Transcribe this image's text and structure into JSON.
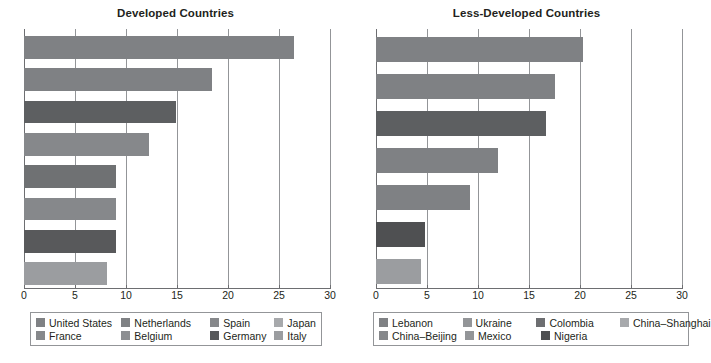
{
  "chart_data": [
    {
      "type": "bar",
      "orientation": "horizontal",
      "title": "Developed Countries",
      "xlabel": "",
      "ylabel": "",
      "xlim": [
        0,
        30
      ],
      "xticks": [
        0,
        5,
        10,
        15,
        20,
        25,
        30
      ],
      "grid": true,
      "legend_position": "bottom",
      "categories": [
        "United States",
        "Netherlands",
        "Spain",
        "Japan",
        "France",
        "Belgium",
        "Germany",
        "Italy"
      ],
      "values": [
        26.5,
        18.4,
        14.9,
        12.3,
        9.0,
        9.0,
        9.0,
        8.1
      ],
      "colors": [
        "#7f8184",
        "#7f8184",
        "#5d5f61",
        "#86888b",
        "#6f7173",
        "#86888b",
        "#58595b",
        "#9b9da0"
      ],
      "legend": [
        {
          "label": "United States",
          "color": "#7f8184"
        },
        {
          "label": "Netherlands",
          "color": "#7f8184"
        },
        {
          "label": "Spain",
          "color": "#86888b"
        },
        {
          "label": "Japan",
          "color": "#a7a9ac"
        },
        {
          "label": "France",
          "color": "#86888b"
        },
        {
          "label": "Belgium",
          "color": "#8d8f92"
        },
        {
          "label": "Germany",
          "color": "#58595b"
        },
        {
          "label": "Italy",
          "color": "#9b9da0"
        }
      ]
    },
    {
      "type": "bar",
      "orientation": "horizontal",
      "title": "Less-Developed Countries",
      "xlabel": "",
      "ylabel": "",
      "xlim": [
        0,
        30
      ],
      "xticks": [
        0,
        5,
        10,
        15,
        20,
        25,
        30
      ],
      "grid": true,
      "legend_position": "bottom",
      "categories": [
        "Lebanon",
        "Ukraine",
        "Colombia",
        "China–Shanghai",
        "China–Beijing",
        "Mexico",
        "Nigeria"
      ],
      "values": [
        20.3,
        17.5,
        16.7,
        12.0,
        9.2,
        4.8,
        4.4
      ],
      "colors": [
        "#7f8184",
        "#7f8184",
        "#5d5f61",
        "#7f8184",
        "#7f8184",
        "#4f5052",
        "#9b9da0"
      ],
      "legend": [
        {
          "label": "Lebanon",
          "color": "#7f8184"
        },
        {
          "label": "Ukraine",
          "color": "#939598"
        },
        {
          "label": "Colombia",
          "color": "#6d6e71"
        },
        {
          "label": "China–Shanghai",
          "color": "#a7a9ac"
        },
        {
          "label": "China–Beijing",
          "color": "#86888b"
        },
        {
          "label": "Mexico",
          "color": "#939598"
        },
        {
          "label": "Nigeria",
          "color": "#4f5052"
        }
      ]
    }
  ],
  "left_panel": {
    "title": "Developed Countries",
    "ticks": [
      "0",
      "5",
      "10",
      "15",
      "20",
      "25",
      "30"
    ],
    "legend_rows": [
      [
        "United States",
        "Netherlands",
        "Spain",
        "Japan"
      ],
      [
        "France",
        "Belgium",
        "Germany",
        "Italy"
      ]
    ]
  },
  "right_panel": {
    "title": "Less-Developed Countries",
    "ticks": [
      "0",
      "5",
      "10",
      "15",
      "20",
      "25",
      "30"
    ],
    "legend_rows": [
      [
        "Lebanon",
        "Ukraine",
        "Colombia",
        "China–Shanghai"
      ],
      [
        "China–Beijing",
        "Mexico",
        "Nigeria"
      ]
    ]
  }
}
